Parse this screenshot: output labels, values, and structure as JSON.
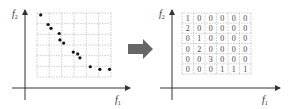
{
  "left_panel": {
    "y_axis_label": "f",
    "y_axis_sub": "2",
    "x_axis_label": "f",
    "x_axis_sub": "1",
    "grid": {
      "cols": 6,
      "rows": 6
    },
    "points": [
      [
        0.05,
        0.97
      ],
      [
        0.15,
        0.82
      ],
      [
        0.19,
        0.76
      ],
      [
        0.3,
        0.68
      ],
      [
        0.31,
        0.58
      ],
      [
        0.36,
        0.53
      ],
      [
        0.49,
        0.39
      ],
      [
        0.55,
        0.36
      ],
      [
        0.58,
        0.3
      ],
      [
        0.72,
        0.16
      ],
      [
        0.85,
        0.12
      ],
      [
        0.98,
        0.12
      ]
    ]
  },
  "arrow": {
    "color": "#666666"
  },
  "right_panel": {
    "y_axis_label": "f",
    "y_axis_sub": "2",
    "x_axis_label": "f",
    "x_axis_sub": "1",
    "matrix": [
      [
        "1",
        "0",
        "0",
        "0",
        "0",
        "0"
      ],
      [
        "2",
        "0",
        "0",
        "0",
        "0",
        "0"
      ],
      [
        "0",
        "1",
        "0",
        "0",
        "0",
        "0"
      ],
      [
        "0",
        "2",
        "0",
        "0",
        "0",
        "0"
      ],
      [
        "0",
        "0",
        "3",
        "0",
        "0",
        "0"
      ],
      [
        "0",
        "0",
        "0",
        "1",
        "1",
        "1"
      ]
    ]
  }
}
